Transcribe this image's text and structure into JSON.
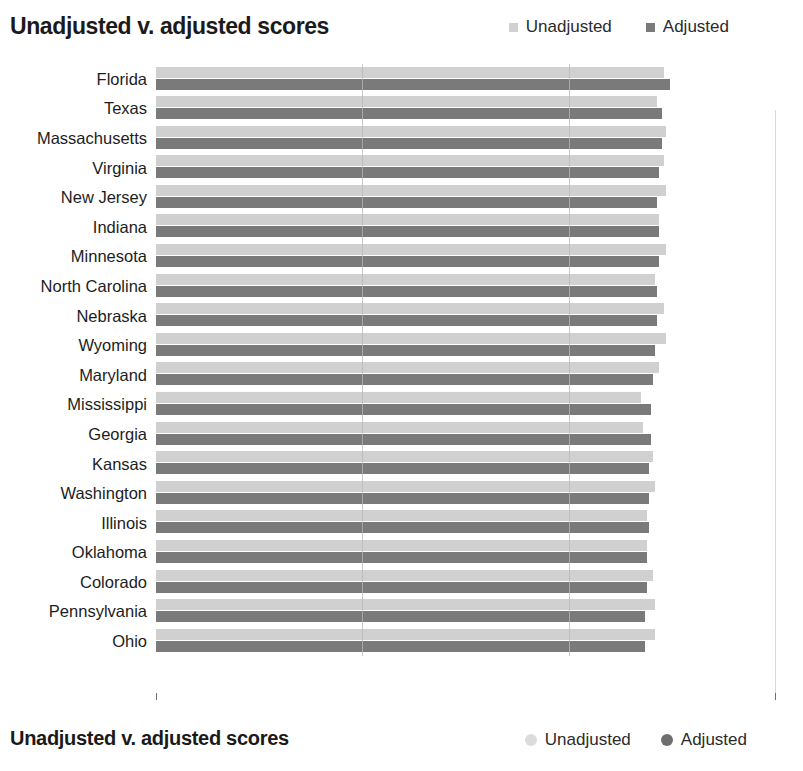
{
  "header": {
    "title": "Unadjusted v. adjusted scores"
  },
  "legend": {
    "items": [
      {
        "label": "Unadjusted",
        "color": "#d0d0d0",
        "icon": "square-swatch"
      },
      {
        "label": "Adjusted",
        "color": "#7a7a7a",
        "icon": "square-swatch"
      }
    ]
  },
  "footer": {
    "title": "Unadjusted v. adjusted scores",
    "legend": [
      {
        "label": "Unadjusted",
        "color": "#dcdcdc",
        "icon": "circle-swatch"
      },
      {
        "label": "Adjusted",
        "color": "#6e6e6e",
        "icon": "circle-swatch"
      }
    ]
  },
  "axis": {
    "x_ticks": [
      "0",
      "100",
      "200",
      "300"
    ],
    "x_min": 0,
    "x_max": 300
  },
  "chart_data": {
    "type": "bar",
    "orientation": "horizontal",
    "title": "Unadjusted v. adjusted scores",
    "xlabel": "",
    "ylabel": "",
    "xlim": [
      0,
      300
    ],
    "grid": true,
    "grid_axis": "x",
    "legend_position": "top-right",
    "categories": [
      "Florida",
      "Texas",
      "Massachusetts",
      "Virginia",
      "New Jersey",
      "Indiana",
      "Minnesota",
      "North Carolina",
      "Nebraska",
      "Wyoming",
      "Maryland",
      "Mississippi",
      "Georgia",
      "Kansas",
      "Washington",
      "Illinois",
      "Oklahoma",
      "Colorado",
      "Pennsylvania",
      "Ohio"
    ],
    "series": [
      {
        "name": "Unadjusted",
        "color": "#d0d0d0",
        "values": [
          246,
          243,
          247,
          246,
          247,
          244,
          247,
          242,
          246,
          247,
          244,
          235,
          236,
          241,
          242,
          238,
          238,
          241,
          242,
          242
        ]
      },
      {
        "name": "Adjusted",
        "color": "#7a7a7a",
        "values": [
          249,
          245,
          245,
          244,
          243,
          244,
          244,
          243,
          243,
          242,
          241,
          240,
          240,
          239,
          239,
          239,
          238,
          238,
          237,
          237
        ]
      }
    ]
  }
}
